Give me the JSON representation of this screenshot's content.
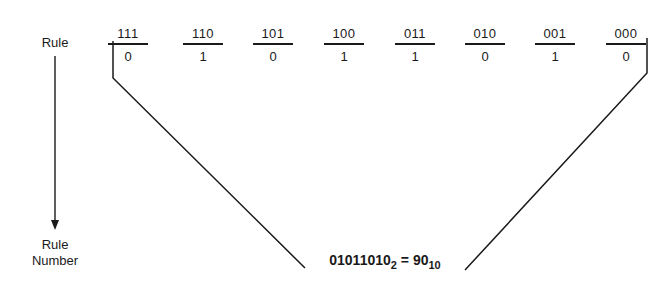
{
  "diagram": {
    "left_label_top": "Rule",
    "left_label_bottom_line1": "Rule",
    "left_label_bottom_line2": "Number",
    "columns": [
      {
        "pattern": "111",
        "bit": "0"
      },
      {
        "pattern": "110",
        "bit": "1"
      },
      {
        "pattern": "101",
        "bit": "0"
      },
      {
        "pattern": "100",
        "bit": "1"
      },
      {
        "pattern": "011",
        "bit": "1"
      },
      {
        "pattern": "010",
        "bit": "0"
      },
      {
        "pattern": "001",
        "bit": "1"
      },
      {
        "pattern": "000",
        "bit": "0"
      }
    ],
    "formula": {
      "binary": "01011010",
      "binary_base": "2",
      "equals": "=",
      "decimal": "90",
      "decimal_base": "10"
    }
  }
}
